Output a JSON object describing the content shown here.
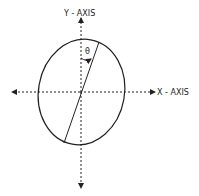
{
  "diagram": {
    "y_axis_label": "Y - AXIS",
    "x_axis_label": "X - AXIS",
    "angle_label": "θ",
    "colors": {
      "stroke": "#222222",
      "background": "#ffffff"
    }
  }
}
